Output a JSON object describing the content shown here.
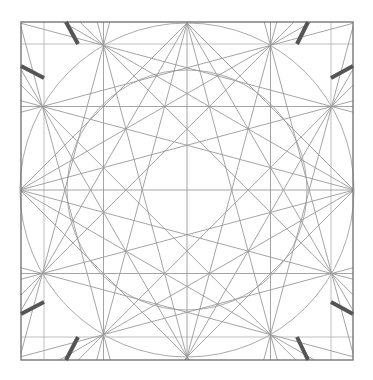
{
  "diagram": {
    "title": "",
    "type": "geometric-star-construction",
    "center": [
      187,
      190
    ],
    "frame": {
      "x1": 21,
      "y1": 22,
      "x2": 353,
      "y2": 360
    },
    "inner_grid": {
      "x": [
        44,
        331
      ],
      "y": [
        44,
        337
      ]
    },
    "circles": [
      {
        "name": "outer-circle",
        "r": 167
      },
      {
        "name": "inner-circle",
        "r": 120
      }
    ],
    "star": {
      "points": 12,
      "radius": 167,
      "steps": [
        3,
        4,
        5
      ]
    },
    "colors": {
      "thin": "#9a9a9a",
      "grid": "#b8b8b8",
      "frame": "#777777",
      "thick": "#555555"
    },
    "thick_marks": [
      [
        66,
        22,
        78,
        44
      ],
      [
        21,
        66,
        44,
        78
      ],
      [
        308,
        22,
        297,
        44
      ],
      [
        353,
        66,
        331,
        78
      ],
      [
        21,
        314,
        44,
        302
      ],
      [
        66,
        360,
        78,
        337
      ],
      [
        353,
        314,
        331,
        302
      ],
      [
        308,
        360,
        297,
        337
      ]
    ]
  }
}
